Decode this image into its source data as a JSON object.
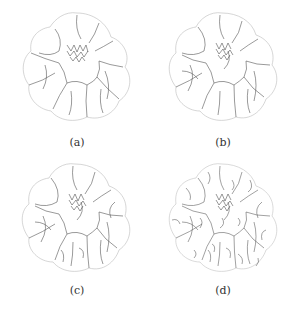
{
  "figure": {
    "panels": [
      {
        "label": "(a)",
        "description": "flower segmentation outline, coarse"
      },
      {
        "label": "(b)",
        "description": "flower segmentation outline, medium"
      },
      {
        "label": "(c)",
        "description": "flower segmentation outline, finer"
      },
      {
        "label": "(d)",
        "description": "flower segmentation outline, finest"
      }
    ],
    "colors": {
      "stroke": "#444444",
      "light_stroke": "#bbbbbb",
      "background": "#ffffff"
    }
  }
}
